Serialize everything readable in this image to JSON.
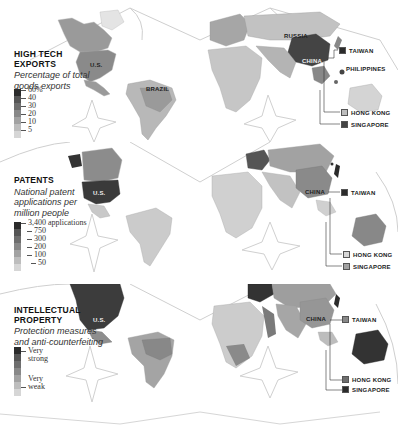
{
  "panels": [
    {
      "id": "high-tech-exports",
      "title_line1": "HIGH TECH",
      "title_line2": "EXPORTS",
      "subtitle_line1": "Percentage of total",
      "subtitle_line2": "goods exports",
      "legend": {
        "ticks": [
          "60%",
          "40",
          "30",
          "20",
          "10",
          "5"
        ],
        "colors": [
          "#2b2b2b",
          "#555555",
          "#6e6e6e",
          "#888888",
          "#a2a2a2",
          "#bdbdbd",
          "#d6d6d6"
        ]
      },
      "map_labels": [
        "U.S.",
        "BRAZIL",
        "RUSSIA",
        "CHINA",
        "PHILIPPINES"
      ],
      "callouts": [
        {
          "label": "TAIWAN",
          "color": "#2b2b2b"
        },
        {
          "label": "HONG KONG",
          "color": "#bdbdbd"
        },
        {
          "label": "SINGAPORE",
          "color": "#444444"
        }
      ]
    },
    {
      "id": "patents",
      "title_line1": "PATENTS",
      "title_line2": "",
      "subtitle_line1": "National patent",
      "subtitle_line2": "applications per",
      "subtitle_line3": "million people",
      "legend": {
        "ticks": [
          "3,400 applications",
          "750",
          "300",
          "200",
          "100",
          "50"
        ],
        "colors": [
          "#2b2b2b",
          "#555555",
          "#6e6e6e",
          "#888888",
          "#a2a2a2",
          "#bdbdbd",
          "#d6d6d6"
        ]
      },
      "map_labels": [
        "U.S.",
        "CHINA"
      ],
      "callouts": [
        {
          "label": "TAIWAN",
          "color": "#2b2b2b"
        },
        {
          "label": "HONG KONG",
          "color": "#d6d6d6"
        },
        {
          "label": "SINGAPORE",
          "color": "#a2a2a2"
        }
      ]
    },
    {
      "id": "intellectual-property",
      "title_line1": "INTELLECTUAL",
      "title_line2": "PROPERTY",
      "subtitle_line1": "Protection measures",
      "subtitle_line2": "and anti-counterfeiting",
      "legend": {
        "ticks": [
          "Very strong",
          "Very weak"
        ],
        "colors": [
          "#2b2b2b",
          "#555555",
          "#6e6e6e",
          "#888888",
          "#a2a2a2",
          "#bdbdbd",
          "#d6d6d6"
        ]
      },
      "map_labels": [
        "U.S.",
        "CHINA"
      ],
      "callouts": [
        {
          "label": "TAIWAN",
          "color": "#888888"
        },
        {
          "label": "HONG KONG",
          "color": "#6e6e6e"
        },
        {
          "label": "SINGAPORE",
          "color": "#2b2b2b"
        }
      ]
    }
  ],
  "legend_ticks_split": {
    "ip_top_1": "Very",
    "ip_top_2": "strong",
    "ip_bot_1": "Very",
    "ip_bot_2": "weak"
  },
  "colors": {
    "background": "#ffffff",
    "land_base": "#d8d8d8",
    "outline": "#c8c8c8",
    "darkest": "#2b2b2b"
  }
}
